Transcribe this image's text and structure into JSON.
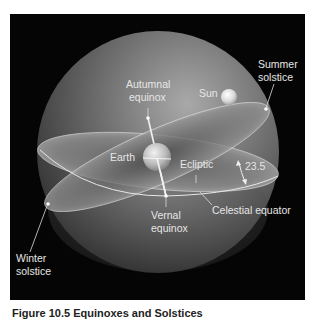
{
  "figure": {
    "panel_bg": "#050505",
    "labels": {
      "summer_solstice_line1": "Summer",
      "summer_solstice_line2": "solstice",
      "sun": "Sun",
      "autumnal_line1": "Autumnal",
      "autumnal_line2": "equinox",
      "earth": "Earth",
      "ecliptic": "Ecliptic",
      "angle": "23.5",
      "celestial_equator": "Celestial equator",
      "vernal_line1": "Vernal",
      "vernal_line2": "equinox",
      "winter_solstice_line1": "Winter",
      "winter_solstice_line2": "solstice"
    },
    "caption": {
      "number": "Figure 10.5",
      "title": "Equinoxes and Solstices"
    }
  }
}
